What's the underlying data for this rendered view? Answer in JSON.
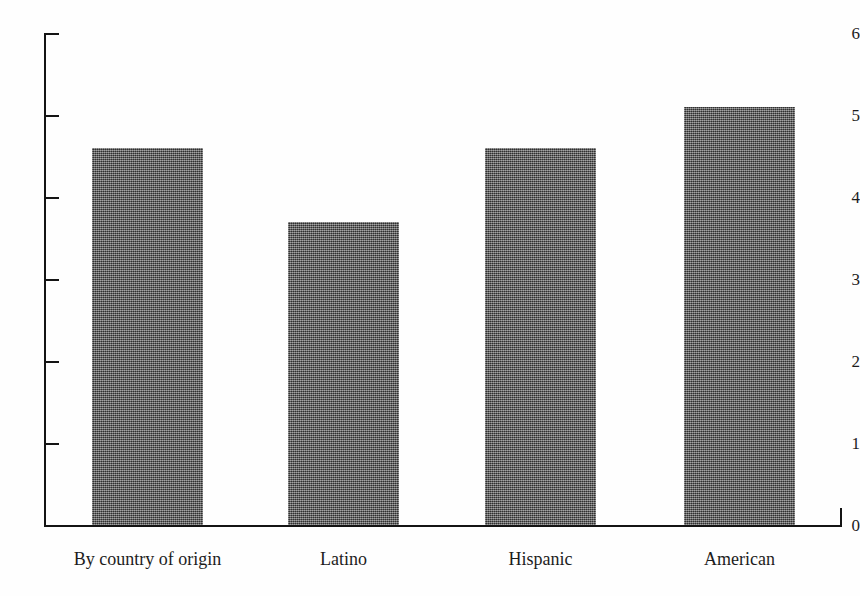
{
  "chart_data": {
    "type": "bar",
    "title": "",
    "subtitle": "",
    "xlabel": "",
    "ylabel": "",
    "categories": [
      "By country of origin",
      "Latino",
      "Hispanic",
      "American"
    ],
    "values": [
      4.6,
      3.7,
      4.6,
      5.1
    ],
    "ylim": [
      0,
      6
    ],
    "yticks": [
      0,
      1,
      2,
      3,
      4,
      5,
      6
    ],
    "ytick_labels": [
      "0",
      "1",
      "2",
      "3",
      "4",
      "5",
      "6"
    ],
    "xlim": [
      0,
      4
    ],
    "grid": false,
    "legend": null,
    "legend_position": "none",
    "annotations": [],
    "series": [
      {
        "name": "",
        "values": [
          4.6,
          3.7,
          4.6,
          5.1
        ],
        "color": "#4d4d4d"
      }
    ]
  },
  "axis": {
    "y_tick_labels": [
      "6",
      "5",
      "4",
      "3",
      "2",
      "1",
      "0"
    ],
    "tick_direction": "inward"
  },
  "colors": {
    "bar_fill": "#4d4d4d",
    "axis": "#141414",
    "text": "#1c1c1c",
    "background": "#fefefe"
  }
}
